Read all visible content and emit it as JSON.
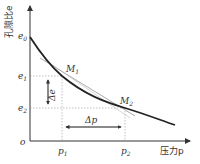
{
  "diagram": {
    "y_axis_label": "孔隙比e",
    "x_axis_label": "压力p",
    "origin_label": "o",
    "y_ticks": [
      "e0",
      "e1",
      "e2"
    ],
    "y_tick_labels": {
      "e0": "e",
      "e0_sub": "0",
      "e1": "e",
      "e1_sub": "1",
      "e2": "e",
      "e2_sub": "2"
    },
    "x_tick_labels": {
      "p1": "p",
      "p1_sub": "1",
      "p2": "p",
      "p2_sub": "2"
    },
    "points": {
      "M1": "M",
      "M1_sub": "1",
      "M2": "M",
      "M2_sub": "2"
    },
    "delta_e": "Δe",
    "delta_p": "Δp",
    "colors": {
      "curve": "#222222",
      "axis": "#333333",
      "guide": "#999999",
      "chord": "#888888"
    }
  }
}
